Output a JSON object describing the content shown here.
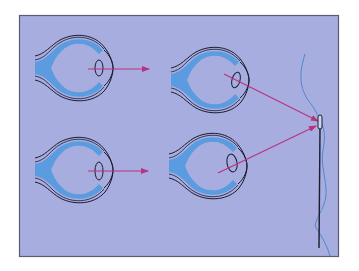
{
  "diagram": {
    "title": "",
    "colors": {
      "background": "#a8addf",
      "frame_border": "#5a5c72",
      "eye_outline": "#1a1a2e",
      "eye_fill": "#5b9be0",
      "arrow": "#b8327e",
      "needle": "#1c1c2c",
      "thread": "#4f86cf"
    },
    "panels": [
      {
        "id": "top-left",
        "label": "",
        "lens": "thin",
        "ray_target": "distance"
      },
      {
        "id": "top-right",
        "label": "",
        "lens": "thin",
        "ray_target": "needle"
      },
      {
        "id": "bottom-left",
        "label": "",
        "lens": "thick",
        "ray_target": "distance"
      },
      {
        "id": "bottom-right",
        "label": "",
        "lens": "thick",
        "ray_target": "needle"
      }
    ],
    "object": "needle-and-thread"
  }
}
